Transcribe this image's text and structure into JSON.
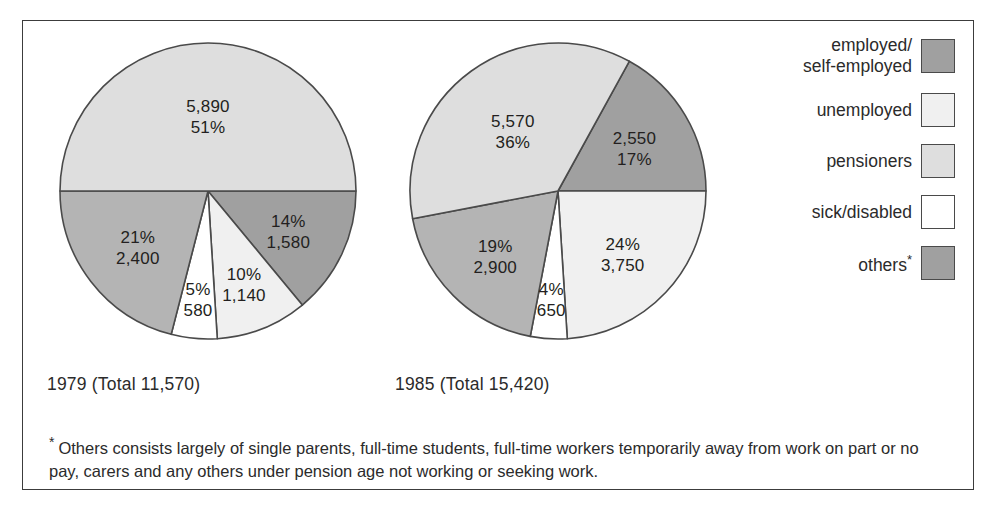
{
  "chart_data": [
    {
      "type": "pie",
      "title": "1979 (Total 11,570)",
      "year": "1979",
      "total": "11,570",
      "categories": [
        "employed/self-employed",
        "unemployed",
        "sick/disabled",
        "others",
        "pensioners"
      ],
      "values": [
        1580,
        1140,
        580,
        2400,
        5890
      ],
      "percents": [
        14,
        10,
        5,
        21,
        51
      ],
      "slices": [
        {
          "category": "employed/self-employed",
          "value": "1,580",
          "percent": "14%",
          "label_line1": "14%",
          "label_line2": "1,580",
          "color": "#a0a0a0",
          "start_angle": 90,
          "end_angle": 140.4
        },
        {
          "category": "unemployed",
          "value": "1,140",
          "percent": "10%",
          "label_line1": "10%",
          "label_line2": "1,140",
          "color": "#f0f0f0",
          "start_angle": 140.4,
          "end_angle": 176.4
        },
        {
          "category": "sick/disabled",
          "value": "580",
          "percent": "5%",
          "label_line1": "5%",
          "label_line2": "580",
          "color": "#ffffff",
          "start_angle": 176.4,
          "end_angle": 194.4
        },
        {
          "category": "others",
          "value": "2,400",
          "percent": "21%",
          "label_line1": "21%",
          "label_line2": "2,400",
          "color": "#b4b4b4",
          "start_angle": 194.4,
          "end_angle": 270
        },
        {
          "category": "pensioners",
          "value": "5,890",
          "percent": "51%",
          "label_line1": "5,890",
          "label_line2": "51%",
          "color": "#dedede",
          "start_angle": 270,
          "end_angle": 450
        }
      ]
    },
    {
      "type": "pie",
      "title": "1985 (Total 15,420)",
      "year": "1985",
      "total": "15,420",
      "categories": [
        "employed/self-employed",
        "unemployed",
        "sick/disabled",
        "others",
        "pensioners"
      ],
      "values": [
        2550,
        3750,
        650,
        2900,
        5570
      ],
      "percents": [
        17,
        24,
        4,
        19,
        36
      ],
      "slices": [
        {
          "category": "employed/self-employed",
          "value": "2,550",
          "percent": "17%",
          "label_line1": "2,550",
          "label_line2": "17%",
          "color": "#a0a0a0",
          "start_angle": 28.8,
          "end_angle": 90
        },
        {
          "category": "unemployed",
          "value": "3,750",
          "percent": "24%",
          "label_line1": "24%",
          "label_line2": "3,750",
          "color": "#f0f0f0",
          "start_angle": 90,
          "end_angle": 176.4
        },
        {
          "category": "sick/disabled",
          "value": "650",
          "percent": "4%",
          "label_line1": "4%",
          "label_line2": "650",
          "color": "#ffffff",
          "start_angle": 176.4,
          "end_angle": 190.8
        },
        {
          "category": "others",
          "value": "2,900",
          "percent": "19%",
          "label_line1": "19%",
          "label_line2": "2,900",
          "color": "#b4b4b4",
          "start_angle": 190.8,
          "end_angle": 259.2
        },
        {
          "category": "pensioners",
          "value": "5,570",
          "percent": "36%",
          "label_line1": "5,570",
          "label_line2": "36%",
          "color": "#dedede",
          "start_angle": 259.2,
          "end_angle": 388.8
        }
      ]
    }
  ],
  "legend": {
    "items": [
      {
        "label": "employed/\nself-employed",
        "color": "#a0a0a0",
        "has_star": false
      },
      {
        "label": "unemployed",
        "color": "#f0f0f0",
        "has_star": false
      },
      {
        "label": "pensioners",
        "color": "#dedede",
        "has_star": false
      },
      {
        "label": "sick/disabled",
        "color": "#ffffff",
        "has_star": false
      },
      {
        "label": "others",
        "color": "#a0a0a0",
        "has_star": true
      }
    ]
  },
  "footnote": {
    "marker": "*",
    "text": "Others consists largely of single parents, full-time students, full-time workers temporarily away from work on part or no pay, carers and any others under pension age not working or seeking work."
  }
}
